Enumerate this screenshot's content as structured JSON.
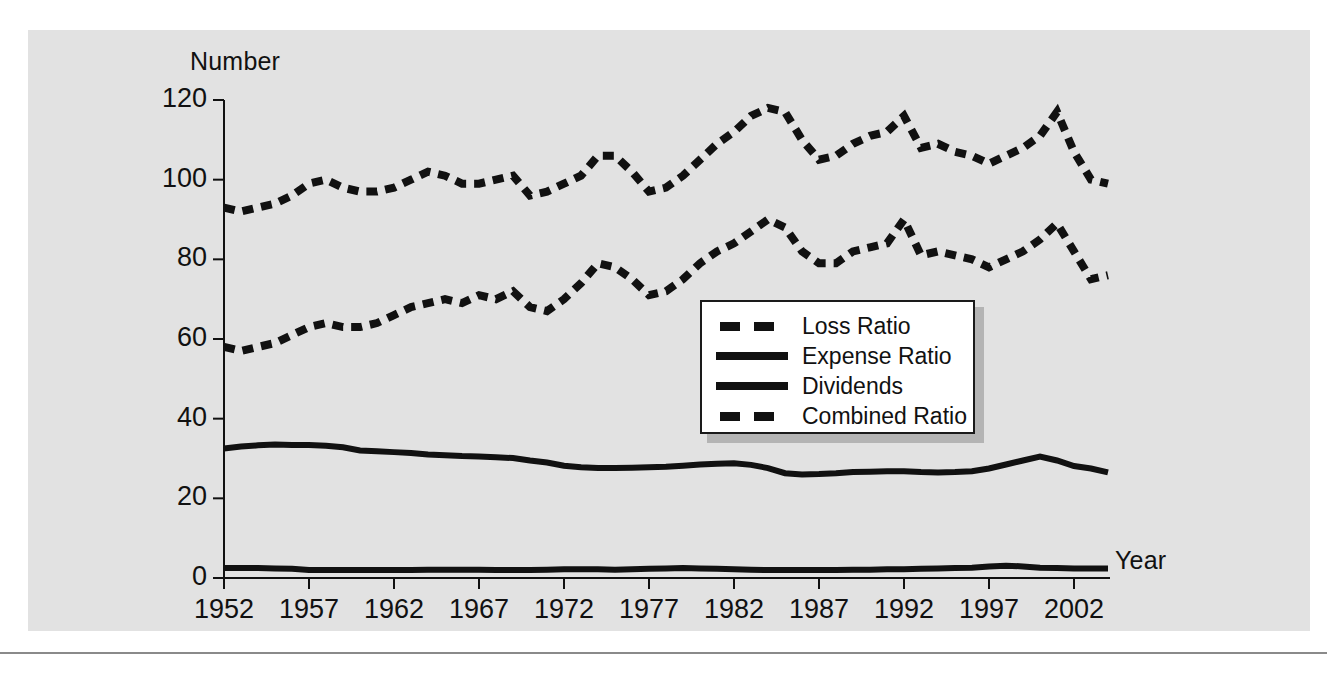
{
  "figure": {
    "panel_color": "#e2e2e2",
    "ink_color": "#111111",
    "ylabel": "Number",
    "xlabel": "Year"
  },
  "legend": {
    "position": "inside-center",
    "items": [
      {
        "label": "Loss Ratio",
        "style": "dashed"
      },
      {
        "label": "Expense Ratio",
        "style": "solid"
      },
      {
        "label": "Dividends",
        "style": "solid"
      },
      {
        "label": "Combined Ratio",
        "style": "dashed"
      }
    ]
  },
  "chart_data": {
    "type": "line",
    "title": "",
    "xlabel": "Year",
    "ylabel": "Number",
    "xlim": [
      1952,
      2004
    ],
    "ylim": [
      0,
      120
    ],
    "yticks": [
      0,
      20,
      40,
      60,
      80,
      100,
      120
    ],
    "xticks": [
      1952,
      1957,
      1962,
      1967,
      1972,
      1977,
      1982,
      1987,
      1992,
      1997,
      2002
    ],
    "grid": false,
    "x": [
      1952,
      1953,
      1954,
      1955,
      1956,
      1957,
      1958,
      1959,
      1960,
      1961,
      1962,
      1963,
      1964,
      1965,
      1966,
      1967,
      1968,
      1969,
      1970,
      1971,
      1972,
      1973,
      1974,
      1975,
      1976,
      1977,
      1978,
      1979,
      1980,
      1981,
      1982,
      1983,
      1984,
      1985,
      1986,
      1987,
      1988,
      1989,
      1990,
      1991,
      1992,
      1993,
      1994,
      1995,
      1996,
      1997,
      1998,
      1999,
      2000,
      2001,
      2002,
      2003,
      2004
    ],
    "series": [
      {
        "name": "Combined Ratio",
        "style": "dashed",
        "values": [
          93,
          92,
          93,
          94,
          96,
          99,
          100,
          98,
          97,
          97,
          98,
          100,
          102,
          101,
          99,
          99,
          100,
          101,
          96,
          97,
          99,
          101,
          106,
          106,
          102,
          97,
          98,
          101,
          105,
          109,
          112,
          116,
          118,
          117,
          110,
          105,
          106,
          109,
          111,
          112,
          116,
          108,
          109,
          107,
          106,
          104,
          106,
          108,
          111,
          117,
          107,
          100,
          99
        ]
      },
      {
        "name": "Loss Ratio",
        "style": "dashed",
        "values": [
          58,
          57,
          58,
          59,
          61,
          63,
          64,
          63,
          63,
          64,
          66,
          68,
          69,
          70,
          69,
          71,
          70,
          72,
          68,
          67,
          70,
          74,
          79,
          78,
          75,
          71,
          72,
          75,
          79,
          82,
          84,
          87,
          90,
          88,
          82,
          79,
          79,
          82,
          83,
          84,
          90,
          81,
          82,
          81,
          80,
          78,
          80,
          82,
          85,
          89,
          82,
          75,
          76
        ]
      },
      {
        "name": "Expense Ratio",
        "style": "solid",
        "values": [
          32.5,
          33,
          33.3,
          33.5,
          33.4,
          33.4,
          33.2,
          32.8,
          32,
          31.8,
          31.6,
          31.4,
          31,
          30.8,
          30.6,
          30.5,
          30.3,
          30.1,
          29.5,
          29,
          28.2,
          27.8,
          27.6,
          27.6,
          27.7,
          27.8,
          27.9,
          28.2,
          28.5,
          28.7,
          28.8,
          28.4,
          27.6,
          26.3,
          26,
          26.1,
          26.3,
          26.6,
          26.7,
          26.8,
          26.8,
          26.6,
          26.5,
          26.6,
          26.8,
          27.5,
          28.5,
          29.5,
          30.5,
          29.5,
          28.1,
          27.5,
          26.5
        ]
      },
      {
        "name": "Dividends",
        "style": "solid",
        "values": [
          2.5,
          2.5,
          2.5,
          2.4,
          2.3,
          2.0,
          2.0,
          2.0,
          2.0,
          2.0,
          2.0,
          2.0,
          2.1,
          2.1,
          2.1,
          2.1,
          2.0,
          2.0,
          2.0,
          2.1,
          2.2,
          2.2,
          2.2,
          2.1,
          2.2,
          2.3,
          2.4,
          2.5,
          2.4,
          2.3,
          2.2,
          2.1,
          2.0,
          2.0,
          2.0,
          2.0,
          2.0,
          2.1,
          2.1,
          2.2,
          2.2,
          2.3,
          2.4,
          2.5,
          2.6,
          2.9,
          3.1,
          2.9,
          2.6,
          2.5,
          2.4,
          2.4,
          2.4
        ]
      }
    ]
  }
}
